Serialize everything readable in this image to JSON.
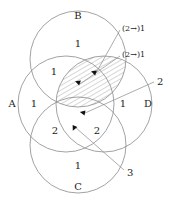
{
  "figure": {
    "kind": "four-circle-venn-diagram",
    "background_color": "#ffffff",
    "stroke_color": "#8a8a8a",
    "text_color": "#1a1a1a",
    "arrow_color": "#111111",
    "hatch_color": "#8a8a8a"
  },
  "sets": [
    {
      "id": "B",
      "label": "B",
      "label_x": 78,
      "label_y": 16,
      "cx": 78,
      "cy": 59,
      "r": 48
    },
    {
      "id": "A",
      "label": "A",
      "label_x": 12,
      "label_y": 104,
      "cx": 66,
      "cy": 104,
      "r": 48
    },
    {
      "id": "D",
      "label": "D",
      "label_x": 148,
      "label_y": 104,
      "cx": 104,
      "cy": 104,
      "r": 48
    },
    {
      "id": "C",
      "label": "C",
      "label_x": 78,
      "label_y": 187,
      "cx": 78,
      "cy": 145,
      "r": 48
    }
  ],
  "region_counts": [
    {
      "value": "1",
      "x": 78,
      "y": 44,
      "region": "B-only"
    },
    {
      "value": "1",
      "x": 54,
      "y": 72,
      "region": "A-and-B"
    },
    {
      "value": "1",
      "x": 34,
      "y": 104,
      "region": "A-only"
    },
    {
      "value": "1",
      "x": 123,
      "y": 104,
      "region": "D-only"
    },
    {
      "value": "2",
      "x": 55,
      "y": 131,
      "region": "A-and-C"
    },
    {
      "value": "2",
      "x": 97,
      "y": 131,
      "region": "C-and-D"
    },
    {
      "value": "1",
      "x": 78,
      "y": 166,
      "region": "C-only"
    }
  ],
  "annotations": [
    {
      "id": "annot-top",
      "text": "(2→)1",
      "x": 122,
      "y": 29,
      "target_x": 96,
      "target_y": 73
    },
    {
      "id": "annot-second",
      "text": "(2→)1",
      "x": 122,
      "y": 55,
      "target_x": 80,
      "target_y": 83
    },
    {
      "id": "annot-two",
      "text": "2",
      "x": 157,
      "y": 82,
      "target_x": 85,
      "target_y": 113
    },
    {
      "id": "annot-three",
      "text": "3",
      "x": 127,
      "y": 173,
      "target_x": 75,
      "target_y": 126
    }
  ],
  "hatched_region": {
    "description": "lens-shaped intersection of B and D, diagonal hatching",
    "hatch_angle_degrees": 60,
    "hatch_spacing_px": 4
  },
  "arrow_markers": [
    {
      "x": 96,
      "y": 73,
      "rotation": 200
    },
    {
      "x": 80,
      "y": 83,
      "rotation": 200
    },
    {
      "x": 85,
      "y": 113,
      "rotation": 190
    },
    {
      "x": 75,
      "y": 126,
      "rotation": 115
    }
  ]
}
